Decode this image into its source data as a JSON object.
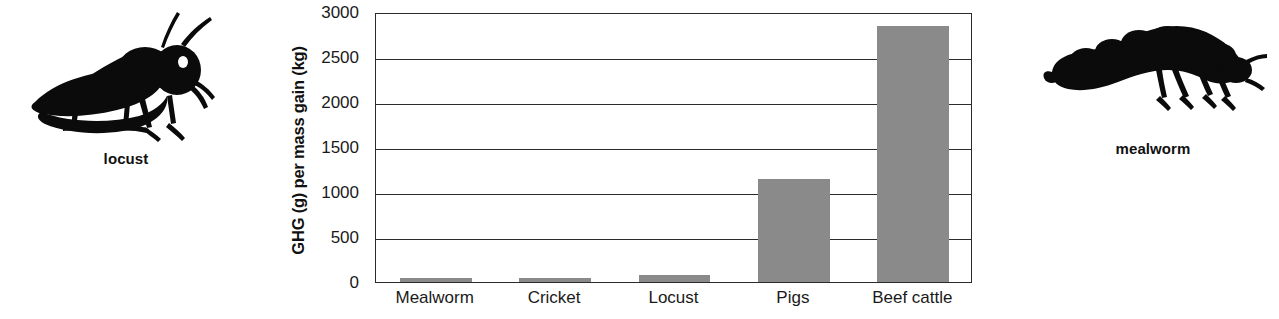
{
  "left_illustration": {
    "caption": "locust",
    "icon": "locust-silhouette"
  },
  "right_illustration": {
    "caption": "mealworm",
    "icon": "mealworm-silhouette"
  },
  "chart_data": {
    "type": "bar",
    "title": "",
    "xlabel": "",
    "ylabel": "GHG (g) per mass gain (kg)",
    "categories": [
      "Mealworm",
      "Cricket",
      "Locust",
      "Pigs",
      "Beef cattle"
    ],
    "values": [
      45,
      50,
      80,
      1150,
      2840
    ],
    "yticks": [
      0,
      500,
      1000,
      1500,
      2000,
      2500,
      3000
    ],
    "ytick_labels": [
      "0",
      "500",
      "1000",
      "1500",
      "2000",
      "2500",
      "3000"
    ],
    "ylim": [
      0,
      3000
    ],
    "grid": true,
    "legend": "none",
    "bar_color": "#8a8a8a",
    "axis_color": "#2b2b2b",
    "text_color": "#1a1a1a"
  }
}
